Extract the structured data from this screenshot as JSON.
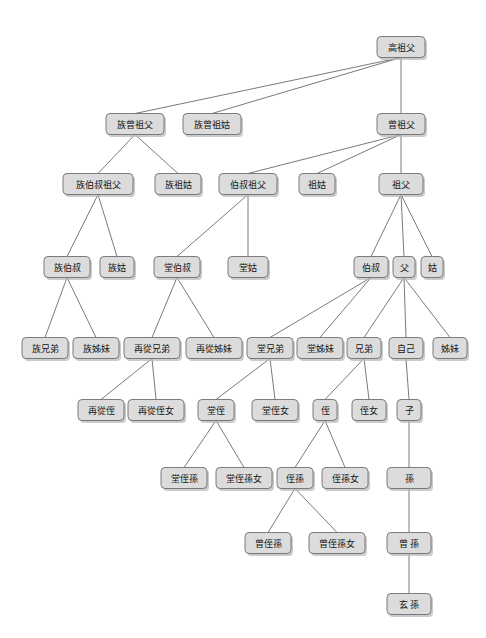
{
  "diagram": {
    "type": "kinship-tree",
    "width": 486,
    "height": 638,
    "background_color": "#ffffff",
    "node_fill": "#dcdcdc",
    "node_stroke": "#6e6e6e",
    "edge_color": "#6b6b6b",
    "text_color": "#141414",
    "nodes": [
      {
        "id": "gaozufu",
        "label": "高祖父",
        "x": 401,
        "y": 47,
        "w": 48,
        "h": 21
      },
      {
        "id": "zuzengzufu",
        "label": "族曾祖父",
        "x": 135,
        "y": 124,
        "w": 58,
        "h": 21
      },
      {
        "id": "zuzengzugu",
        "label": "族曾祖姑",
        "x": 212,
        "y": 124,
        "w": 58,
        "h": 21
      },
      {
        "id": "zengzufu",
        "label": "曾祖父",
        "x": 401,
        "y": 124,
        "w": 48,
        "h": 21
      },
      {
        "id": "zubaishuzufu",
        "label": "族伯叔祖父",
        "x": 98,
        "y": 184,
        "w": 70,
        "h": 21
      },
      {
        "id": "zuzugu",
        "label": "族祖姑",
        "x": 178,
        "y": 184,
        "w": 46,
        "h": 21
      },
      {
        "id": "baishuzufu",
        "label": "伯叔祖父",
        "x": 248,
        "y": 184,
        "w": 58,
        "h": 21
      },
      {
        "id": "zugu",
        "label": "祖姑",
        "x": 317,
        "y": 184,
        "w": 36,
        "h": 21
      },
      {
        "id": "zufu",
        "label": "祖父",
        "x": 401,
        "y": 184,
        "w": 44,
        "h": 21
      },
      {
        "id": "zubaishu",
        "label": "族伯叔",
        "x": 67,
        "y": 267,
        "w": 46,
        "h": 21
      },
      {
        "id": "zugu2",
        "label": "族姑",
        "x": 117,
        "y": 267,
        "w": 34,
        "h": 21
      },
      {
        "id": "tangbaishu",
        "label": "堂伯叔",
        "x": 177,
        "y": 267,
        "w": 46,
        "h": 21
      },
      {
        "id": "tanggu",
        "label": "堂姑",
        "x": 248,
        "y": 267,
        "w": 40,
        "h": 21
      },
      {
        "id": "baishu",
        "label": "伯叔",
        "x": 371,
        "y": 267,
        "w": 34,
        "h": 21
      },
      {
        "id": "fu",
        "label": "父",
        "x": 404,
        "y": 267,
        "w": 22,
        "h": 21
      },
      {
        "id": "gu",
        "label": "姑",
        "x": 432,
        "y": 267,
        "w": 22,
        "h": 21
      },
      {
        "id": "zuxiongdi",
        "label": "族兄弟",
        "x": 45,
        "y": 348,
        "w": 46,
        "h": 21
      },
      {
        "id": "zujiemei",
        "label": "族姊妹",
        "x": 96,
        "y": 348,
        "w": 46,
        "h": 21
      },
      {
        "id": "zaicongxiongdi",
        "label": "再從兄弟",
        "x": 152,
        "y": 348,
        "w": 56,
        "h": 21
      },
      {
        "id": "zaicongjiemei",
        "label": "再從姊妹",
        "x": 214,
        "y": 348,
        "w": 56,
        "h": 21
      },
      {
        "id": "tangxiongdi",
        "label": "堂兄弟",
        "x": 270,
        "y": 348,
        "w": 46,
        "h": 21
      },
      {
        "id": "tangjiemei",
        "label": "堂姊妹",
        "x": 320,
        "y": 348,
        "w": 46,
        "h": 21
      },
      {
        "id": "xiongdi",
        "label": "兄弟",
        "x": 364,
        "y": 348,
        "w": 34,
        "h": 21
      },
      {
        "id": "ziji",
        "label": "自己",
        "x": 406,
        "y": 348,
        "w": 34,
        "h": 21
      },
      {
        "id": "jiemei",
        "label": "姊妹",
        "x": 450,
        "y": 348,
        "w": 34,
        "h": 21
      },
      {
        "id": "zaicongzhi",
        "label": "再從侄",
        "x": 101,
        "y": 410,
        "w": 46,
        "h": 21
      },
      {
        "id": "zaicongzhinv",
        "label": "再從侄女",
        "x": 156,
        "y": 410,
        "w": 56,
        "h": 21
      },
      {
        "id": "tangzhi",
        "label": "堂侄",
        "x": 216,
        "y": 410,
        "w": 36,
        "h": 21
      },
      {
        "id": "tangzhinv",
        "label": "堂侄女",
        "x": 275,
        "y": 410,
        "w": 46,
        "h": 21
      },
      {
        "id": "zhi",
        "label": "侄",
        "x": 325,
        "y": 410,
        "w": 24,
        "h": 21
      },
      {
        "id": "zhinv",
        "label": "侄女",
        "x": 369,
        "y": 410,
        "w": 34,
        "h": 21
      },
      {
        "id": "zi",
        "label": "子",
        "x": 409,
        "y": 410,
        "w": 24,
        "h": 21
      },
      {
        "id": "tangzhisun",
        "label": "堂侄孫",
        "x": 184,
        "y": 478,
        "w": 46,
        "h": 21
      },
      {
        "id": "tangzhisunnv",
        "label": "堂侄孫女",
        "x": 244,
        "y": 478,
        "w": 56,
        "h": 21
      },
      {
        "id": "zhisun",
        "label": "侄孫",
        "x": 295,
        "y": 478,
        "w": 36,
        "h": 21
      },
      {
        "id": "zhisunnv",
        "label": "侄孫女",
        "x": 345,
        "y": 478,
        "w": 46,
        "h": 21
      },
      {
        "id": "sun",
        "label": "孫",
        "x": 409,
        "y": 478,
        "w": 44,
        "h": 21
      },
      {
        "id": "zengzhisun",
        "label": "曾侄孫",
        "x": 268,
        "y": 543,
        "w": 46,
        "h": 21
      },
      {
        "id": "zengzhisunnv",
        "label": "曾侄孫女",
        "x": 337,
        "y": 543,
        "w": 56,
        "h": 21
      },
      {
        "id": "zengsun",
        "label": "曾 孫",
        "x": 409,
        "y": 543,
        "w": 44,
        "h": 21
      },
      {
        "id": "xuansun",
        "label": "玄 孫",
        "x": 409,
        "y": 604,
        "w": 44,
        "h": 21
      }
    ],
    "edges": [
      {
        "from": "gaozufu",
        "to": "zuzengzufu"
      },
      {
        "from": "gaozufu",
        "to": "zuzengzugu"
      },
      {
        "from": "gaozufu",
        "to": "zengzufu"
      },
      {
        "from": "zuzengzufu",
        "to": "zubaishuzufu"
      },
      {
        "from": "zuzengzufu",
        "to": "zuzugu"
      },
      {
        "from": "zengzufu",
        "to": "baishuzufu"
      },
      {
        "from": "zengzufu",
        "to": "zugu"
      },
      {
        "from": "zengzufu",
        "to": "zufu"
      },
      {
        "from": "zubaishuzufu",
        "to": "zubaishu"
      },
      {
        "from": "zubaishuzufu",
        "to": "zugu2"
      },
      {
        "from": "baishuzufu",
        "to": "tangbaishu"
      },
      {
        "from": "baishuzufu",
        "to": "tanggu"
      },
      {
        "from": "zufu",
        "to": "baishu"
      },
      {
        "from": "zufu",
        "to": "fu"
      },
      {
        "from": "zufu",
        "to": "gu"
      },
      {
        "from": "zubaishu",
        "to": "zuxiongdi"
      },
      {
        "from": "zubaishu",
        "to": "zujiemei"
      },
      {
        "from": "tangbaishu",
        "to": "zaicongxiongdi"
      },
      {
        "from": "tangbaishu",
        "to": "zaicongjiemei"
      },
      {
        "from": "baishu",
        "to": "tangxiongdi"
      },
      {
        "from": "baishu",
        "to": "tangjiemei"
      },
      {
        "from": "fu",
        "to": "xiongdi"
      },
      {
        "from": "fu",
        "to": "ziji"
      },
      {
        "from": "fu",
        "to": "jiemei"
      },
      {
        "from": "zaicongxiongdi",
        "to": "zaicongzhi"
      },
      {
        "from": "zaicongxiongdi",
        "to": "zaicongzhinv"
      },
      {
        "from": "tangxiongdi",
        "to": "tangzhi"
      },
      {
        "from": "tangxiongdi",
        "to": "tangzhinv"
      },
      {
        "from": "xiongdi",
        "to": "zhi"
      },
      {
        "from": "xiongdi",
        "to": "zhinv"
      },
      {
        "from": "ziji",
        "to": "zi"
      },
      {
        "from": "tangzhi",
        "to": "tangzhisun"
      },
      {
        "from": "tangzhi",
        "to": "tangzhisunnv"
      },
      {
        "from": "zhi",
        "to": "zhisun"
      },
      {
        "from": "zhi",
        "to": "zhisunnv"
      },
      {
        "from": "zi",
        "to": "sun"
      },
      {
        "from": "zhisun",
        "to": "zengzhisun"
      },
      {
        "from": "zhisun",
        "to": "zengzhisunnv"
      },
      {
        "from": "sun",
        "to": "zengsun"
      },
      {
        "from": "zengsun",
        "to": "xuansun"
      }
    ]
  }
}
